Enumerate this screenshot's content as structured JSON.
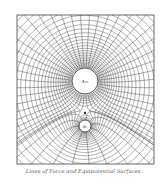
{
  "figure": {
    "caption": "Lines of Force and Equipotential Surfaces.",
    "frame": {
      "x": 17,
      "y": 15,
      "width": 137,
      "height": 149
    },
    "line_color": "#3a3a3a",
    "charges": [
      {
        "id": "A",
        "label": "A₂₀",
        "strength": 20,
        "cx": 85,
        "cy": 81,
        "r": 13
      },
      {
        "id": "B",
        "label": "B₅",
        "strength": 5,
        "cx": 85,
        "cy": 126,
        "r": 6
      }
    ],
    "null_point": {
      "cx": 85,
      "cy": 113
    },
    "field_lines_per_unit": 2.2,
    "equipotential_levels": 26
  }
}
